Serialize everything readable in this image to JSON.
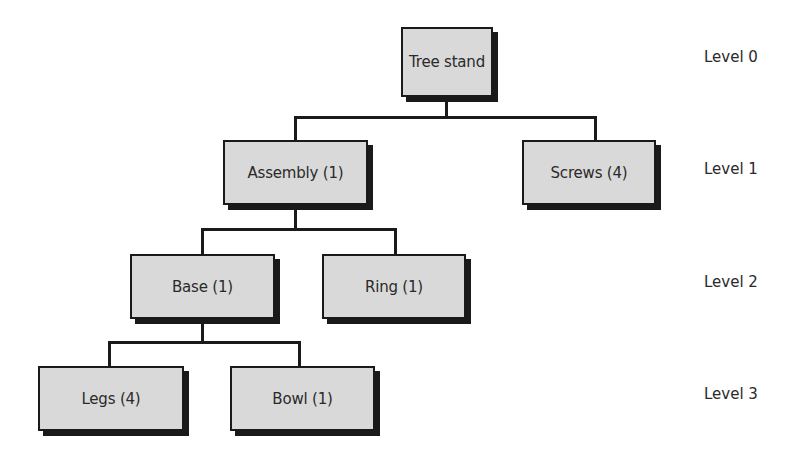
{
  "diagram": {
    "type": "tree",
    "nodes": [
      {
        "id": "tree-stand",
        "label": "Tree stand",
        "level": 0,
        "parent": null
      },
      {
        "id": "assembly",
        "label": "Assembly (1)",
        "level": 1,
        "parent": "tree-stand"
      },
      {
        "id": "screws",
        "label": "Screws (4)",
        "level": 1,
        "parent": "tree-stand"
      },
      {
        "id": "base",
        "label": "Base (1)",
        "level": 2,
        "parent": "assembly"
      },
      {
        "id": "ring",
        "label": "Ring (1)",
        "level": 2,
        "parent": "assembly"
      },
      {
        "id": "legs",
        "label": "Legs (4)",
        "level": 3,
        "parent": "base"
      },
      {
        "id": "bowl",
        "label": "Bowl (1)",
        "level": 3,
        "parent": "base"
      }
    ],
    "levels": [
      "Level 0",
      "Level 1",
      "Level 2",
      "Level 3"
    ],
    "colors": {
      "node_fill": "#d9d9d9",
      "line": "#1a1a1a",
      "shadow": "#1a1a1a"
    }
  }
}
